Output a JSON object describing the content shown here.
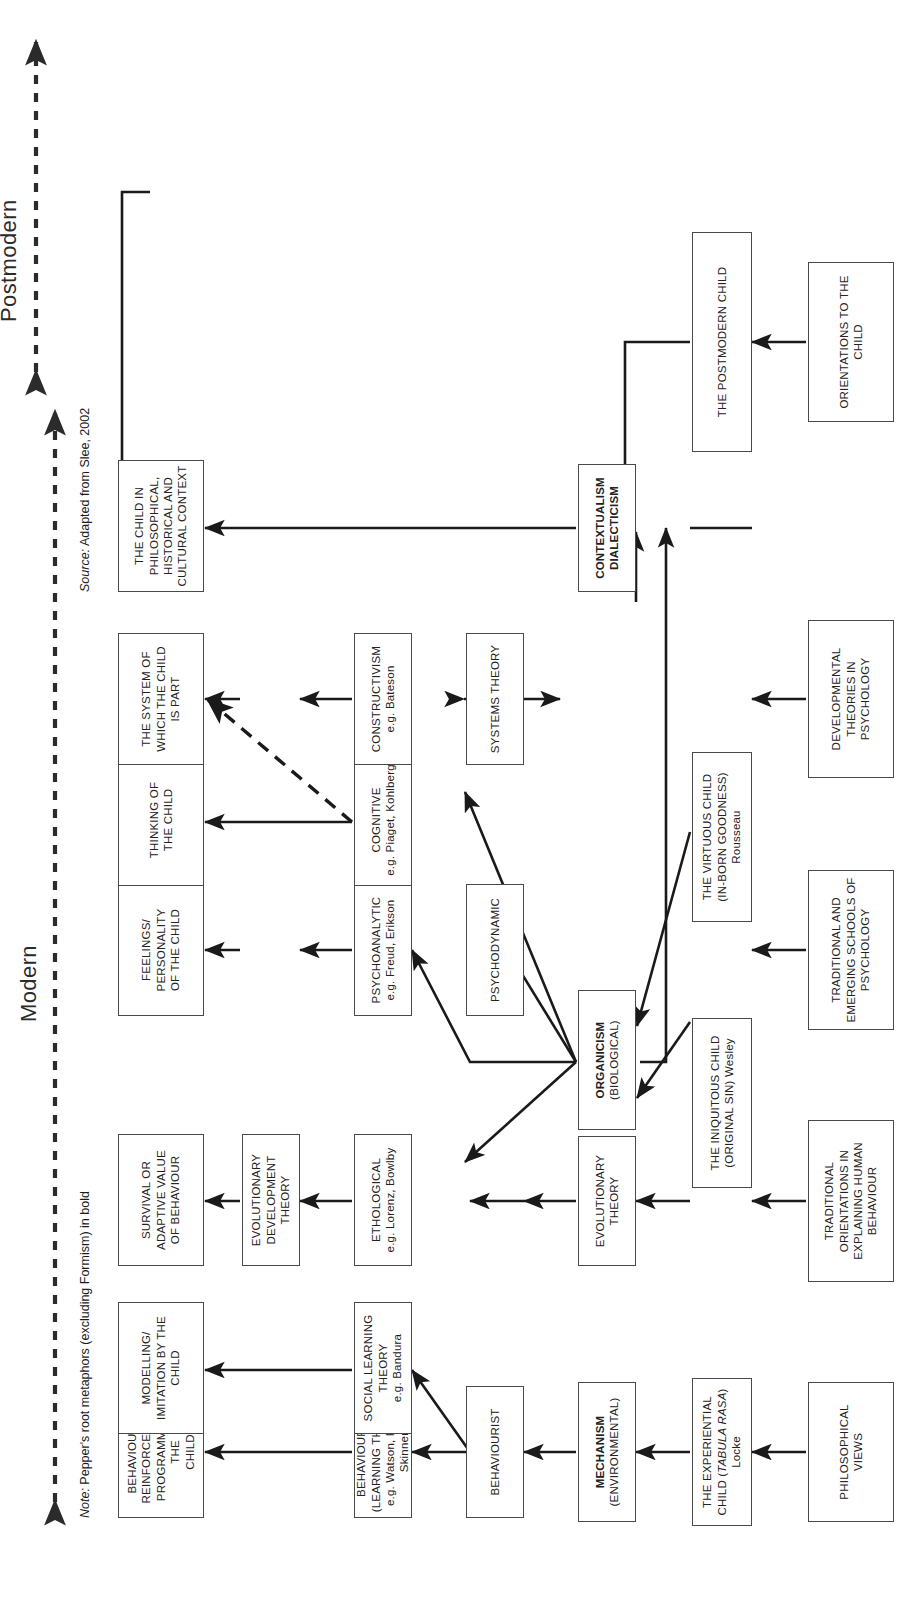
{
  "diagram": {
    "era_axis": [
      {
        "label": "Postmodern"
      },
      {
        "label": "Modern"
      }
    ],
    "source_note": "Adapted from Slee, 2002",
    "source_prefix": "Source:",
    "footnote_prefix": "Note:",
    "footnote": "Pepper's root metaphors (excluding Formism) in bold",
    "row_headers": [
      {
        "id": "philosophical-views",
        "label": "PHILOSOPHICAL VIEWS"
      },
      {
        "id": "traditional-orientations",
        "label": "TRADITIONAL ORIENTATIONS IN EXPLAINING HUMAN BEHAVIOUR"
      },
      {
        "id": "schools-of-psychology",
        "label": "TRADITIONAL AND EMERGING SCHOOLS OF PSYCHOLOGY"
      },
      {
        "id": "developmental-theories",
        "label": "DEVELOPMENTAL THEORIES IN PSYCHOLOGY"
      },
      {
        "id": "orientations-to-child",
        "label": "ORIENTATIONS TO THE CHILD"
      }
    ],
    "philosophical_views": [
      {
        "id": "experiential-child",
        "line1": "THE EXPERIENTIAL",
        "line2": "CHILD (",
        "italic": "TABULA RASA",
        "line2b": ")",
        "line3": "Locke"
      },
      {
        "id": "iniquitous-child",
        "line1": "THE INIQUITOUS CHILD",
        "line2": "(ORIGINAL SIN) Wesley",
        "line3": ""
      },
      {
        "id": "virtuous-child",
        "line1": "THE VIRTUOUS CHILD",
        "line2": "(IN-BORN GOODNESS)",
        "line3": "Rousseau"
      },
      {
        "id": "postmodern-child",
        "line1": "THE POSTMODERN CHILD",
        "line2": "",
        "line3": ""
      }
    ],
    "root_metaphors": [
      {
        "id": "mechanism",
        "bold": "MECHANISM",
        "sub": "(ENVIRONMENTAL)"
      },
      {
        "id": "evolutionary-theory",
        "bold": "",
        "sub": "EVOLUTIONARY THEORY"
      },
      {
        "id": "organicism",
        "bold": "ORGANICISM",
        "sub": "(BIOLOGICAL)"
      },
      {
        "id": "contextualism",
        "bold": "CONTEXTUALISM DIALECTICISM",
        "sub": ""
      }
    ],
    "schools": [
      {
        "id": "behaviourist",
        "label": "BEHAVIOURIST"
      },
      {
        "id": "psychodynamic",
        "label": "PSYCHODYNAMIC"
      },
      {
        "id": "systems-theory",
        "label": "SYSTEMS THEORY"
      }
    ],
    "theories": [
      {
        "id": "behaviourism",
        "line1": "BEHAVIOURISM",
        "line2": "(LEARNING THEORY)",
        "line3": "e.g. Watson, Pavlov,",
        "line4": "Skinner"
      },
      {
        "id": "social-learning",
        "line1": "SOCIAL LEARNING",
        "line2": "THEORY",
        "line3": "e.g. Bandura",
        "line4": ""
      },
      {
        "id": "ethological",
        "line1": "ETHOLOGICAL",
        "line2": "e.g. Lorenz, Bowlby",
        "line3": "",
        "line4": ""
      },
      {
        "id": "evolutionary-development-theory",
        "line1": "EVOLUTIONARY",
        "line2": "DEVELOPMENT",
        "line3": "THEORY",
        "line4": ""
      },
      {
        "id": "psychoanalytic",
        "line1": "PSYCHOANALYTIC",
        "line2": "e.g. Freud, Erikson",
        "line3": "",
        "line4": ""
      },
      {
        "id": "cognitive",
        "line1": "COGNITIVE",
        "line2": "e.g. Piaget, Kohlberg",
        "line3": "",
        "line4": ""
      },
      {
        "id": "constructivism",
        "line1": "CONSTRUCTIVISM",
        "line2": "e.g. Bateson",
        "line3": "",
        "line4": ""
      }
    ],
    "outcomes": [
      {
        "id": "behavioural-reinforcement",
        "line1": "BEHAVIOURAL",
        "line2": "REINFORCEMENT",
        "line3": "PROGRAMME OF THE",
        "line4": "CHILD"
      },
      {
        "id": "modelling-imitation",
        "line1": "MODELLING/",
        "line2": "IMITATION BY THE",
        "line3": "CHILD",
        "line4": ""
      },
      {
        "id": "survival-adaptive",
        "line1": "SURVIVAL OR",
        "line2": "ADAPTIVE VALUE",
        "line3": "OF BEHAVIOUR",
        "line4": ""
      },
      {
        "id": "feelings-personality",
        "line1": "FEELINGS/",
        "line2": "PERSONALITY",
        "line3": "OF THE CHILD",
        "line4": ""
      },
      {
        "id": "thinking-of-child",
        "line1": "THINKING OF",
        "line2": "THE CHILD",
        "line3": "",
        "line4": ""
      },
      {
        "id": "system-of-child",
        "line1": "THE SYSTEM OF",
        "line2": "WHICH THE CHILD",
        "line3": "IS PART",
        "line4": ""
      },
      {
        "id": "child-in-context",
        "line1": "THE CHILD IN",
        "line2": "PHILOSOPHICAL,",
        "line3": "HISTORICAL AND",
        "line4": "CULTURAL CONTEXT"
      }
    ]
  }
}
